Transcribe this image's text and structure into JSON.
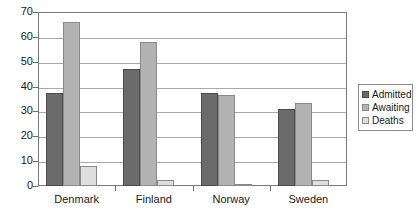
{
  "chart_data": {
    "type": "bar",
    "title": "",
    "subtitle": "",
    "xlabel": "",
    "ylabel": "",
    "categories": [
      "Denmark",
      "Finland",
      "Norway",
      "Sweden"
    ],
    "series": [
      {
        "name": "Admitted",
        "color": "#6b6b6b",
        "values": [
          37.5,
          47,
          37.5,
          31
        ]
      },
      {
        "name": "Awaiting",
        "color": "#b3b3b3",
        "values": [
          66,
          58,
          36.5,
          33.5
        ]
      },
      {
        "name": "Deaths",
        "color": "#dedede",
        "values": [
          8,
          2.5,
          1,
          2.5
        ]
      }
    ],
    "ylim": [
      0,
      70
    ],
    "ytick_labels": [
      "0",
      "10",
      "20",
      "30",
      "40",
      "50",
      "60",
      "70"
    ],
    "ytick_values": [
      0,
      10,
      20,
      30,
      40,
      50,
      60,
      70
    ],
    "grid": true,
    "grid_axis": "y",
    "legend_position": "right"
  }
}
